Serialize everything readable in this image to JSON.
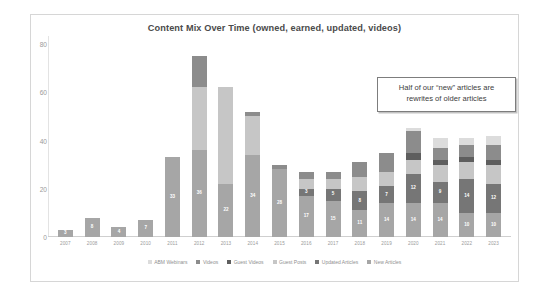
{
  "chart_data": {
    "type": "bar",
    "stacked": true,
    "title": "Content Mix Over Time (owned, earned, updated, videos)",
    "xlabel": "",
    "ylabel": "",
    "ylim": [
      0,
      80
    ],
    "yticks": [
      0,
      20,
      40,
      60,
      80
    ],
    "grid": false,
    "legend_position": "bottom",
    "categories": [
      "2007",
      "2008",
      "2009",
      "2010",
      "2011",
      "2012",
      "2013",
      "2014",
      "2015",
      "2016",
      "2017",
      "2018",
      "2019",
      "2020",
      "2021",
      "2022",
      "2023"
    ],
    "series": [
      {
        "name": "New Articles",
        "color": "#a6a6a6",
        "values": [
          3,
          8,
          4,
          7,
          33,
          36,
          22,
          34,
          28,
          17,
          15,
          11,
          14,
          14,
          14,
          10,
          10
        ],
        "labels": [
          "3",
          "8",
          "4",
          "7",
          "33",
          "36",
          "22",
          "34",
          "28",
          "17",
          "15",
          "11",
          "14",
          "14",
          "14",
          "10",
          "10"
        ]
      },
      {
        "name": "Updated Articles",
        "color": "#767676",
        "values": [
          0,
          0,
          0,
          0,
          0,
          0,
          0,
          0,
          0,
          3,
          5,
          8,
          7,
          12,
          9,
          14,
          12
        ],
        "labels": [
          "",
          "",
          "",
          "",
          "",
          "",
          "",
          "",
          "",
          "3",
          "5",
          "8",
          "7",
          "12",
          "9",
          "14",
          "12"
        ]
      },
      {
        "name": "Guest Posts",
        "color": "#c6c6c6",
        "values": [
          0,
          0,
          0,
          0,
          0,
          26,
          40,
          16,
          0,
          4,
          4,
          6,
          6,
          6,
          7,
          7,
          8
        ],
        "labels": [
          "",
          "",
          "",
          "",
          "",
          "",
          "",
          "",
          "",
          "",
          "",
          "",
          "",
          "",
          "",
          "",
          ""
        ]
      },
      {
        "name": "Guest Videos",
        "color": "#5e5e5e",
        "values": [
          0,
          0,
          0,
          0,
          0,
          0,
          0,
          0,
          0,
          0,
          0,
          0,
          0,
          3,
          2,
          2,
          2
        ],
        "labels": [
          "",
          "",
          "",
          "",
          "",
          "",
          "",
          "",
          "",
          "",
          "",
          "",
          "",
          "",
          "",
          "",
          ""
        ]
      },
      {
        "name": "Videos",
        "color": "#8c8c8c",
        "values": [
          0,
          0,
          0,
          0,
          0,
          13,
          0,
          2,
          2,
          3,
          3,
          6,
          8,
          9,
          5,
          5,
          6
        ],
        "labels": [
          "",
          "",
          "",
          "",
          "",
          "",
          "",
          "",
          "",
          "",
          "",
          "",
          "",
          "",
          "",
          "",
          ""
        ]
      },
      {
        "name": "ABM Webinars",
        "color": "#dcdcdc",
        "values": [
          0,
          0,
          0,
          0,
          0,
          0,
          0,
          0,
          0,
          0,
          0,
          0,
          0,
          1,
          4,
          3,
          4
        ],
        "labels": [
          "",
          "",
          "",
          "",
          "",
          "",
          "",
          "",
          "",
          "",
          "",
          "",
          "",
          "",
          "",
          "",
          ""
        ]
      }
    ],
    "annotation": {
      "line1": "Half of our “new” articles are",
      "line2": "rewrites of older articles"
    }
  },
  "legend": {
    "items": [
      {
        "label": "ABM Webinars",
        "color": "#dcdcdc"
      },
      {
        "label": "Videos",
        "color": "#8c8c8c"
      },
      {
        "label": "Guest Videos",
        "color": "#5e5e5e"
      },
      {
        "label": "Guest Posts",
        "color": "#c6c6c6"
      },
      {
        "label": "Updated Articles",
        "color": "#767676"
      },
      {
        "label": "New Articles",
        "color": "#a6a6a6"
      }
    ]
  }
}
